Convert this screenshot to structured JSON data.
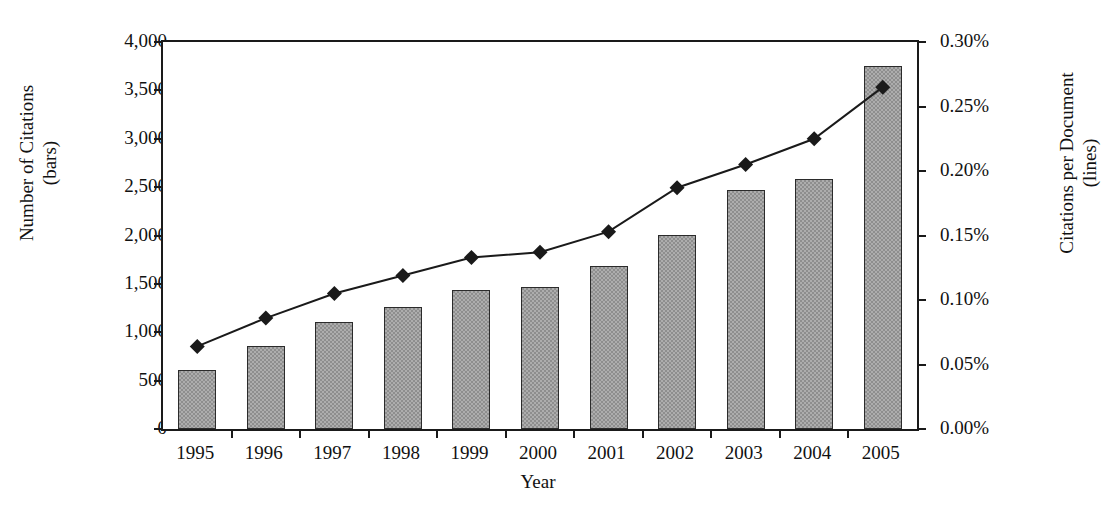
{
  "chart_data": {
    "type": "bar",
    "title": "",
    "xlabel": "Year",
    "ylabel": "Number of Citations\n(bars)",
    "ylabel_right": "Citations per Document\n(lines)",
    "categories": [
      "1995",
      "1996",
      "1997",
      "1998",
      "1999",
      "2000",
      "2001",
      "2002",
      "2003",
      "2004",
      "2005"
    ],
    "series": [
      {
        "name": "Number of Citations (bars)",
        "type": "bar",
        "axis": "left",
        "values": [
          610,
          860,
          1105,
          1260,
          1440,
          1465,
          1685,
          2010,
          2475,
          2585,
          3750
        ]
      },
      {
        "name": "Citations per Document (lines)",
        "type": "line",
        "axis": "right",
        "values": [
          0.064,
          0.086,
          0.105,
          0.119,
          0.133,
          0.137,
          0.153,
          0.187,
          0.205,
          0.225,
          0.265
        ]
      }
    ],
    "ylim": [
      0,
      4000
    ],
    "ylim_right": [
      0,
      0.3
    ],
    "yticks": [
      0,
      500,
      1000,
      1500,
      2000,
      2500,
      3000,
      3500,
      4000
    ],
    "ytick_labels": [
      "0",
      "500",
      "1,000",
      "1,500",
      "2,000",
      "2,500",
      "3,000",
      "3,500",
      "4,000"
    ],
    "yticks_right": [
      0,
      0.05,
      0.1,
      0.15,
      0.2,
      0.25,
      0.3
    ],
    "ytick_labels_right": [
      "0.00%",
      "0.05%",
      "0.10%",
      "0.15%",
      "0.20%",
      "0.25%",
      "0.30%"
    ],
    "grid": false,
    "legend": "none",
    "bar_color": "#8e8e8e",
    "bar_edge_color": "#2b2b2b",
    "line_color": "#1a1a1a",
    "marker": "diamond"
  }
}
